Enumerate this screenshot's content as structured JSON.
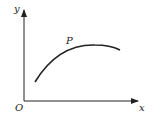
{
  "diagram": {
    "type": "coordinate-curve",
    "axes": {
      "x_label": "x",
      "y_label": "y",
      "origin_label": "O"
    },
    "curve": {
      "point_label": "P",
      "shape": "concave-down arc"
    },
    "colors": {
      "line": "#222222",
      "background": "#ffffff"
    }
  }
}
